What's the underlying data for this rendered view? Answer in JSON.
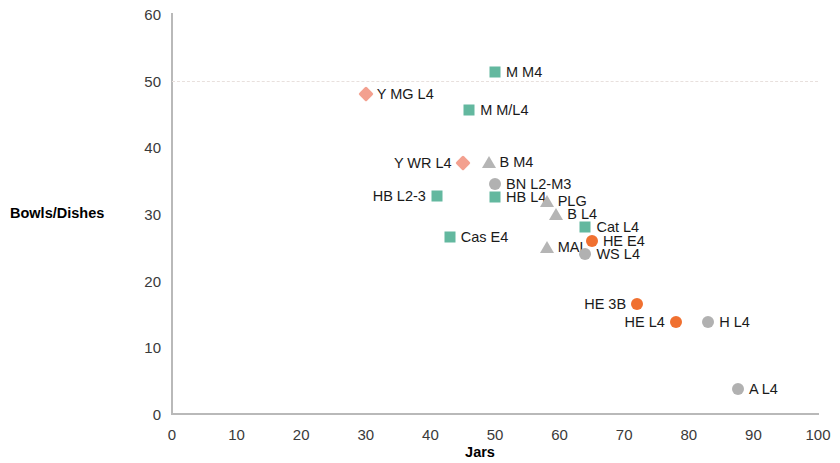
{
  "chart_data": {
    "type": "scatter",
    "title": "",
    "xlabel": "Jars",
    "ylabel": "Bowls/Dishes",
    "xlim": [
      0,
      100
    ],
    "ylim": [
      0,
      60
    ],
    "xticks": [
      0,
      10,
      20,
      30,
      40,
      50,
      60,
      70,
      80,
      90,
      100
    ],
    "yticks": [
      0,
      10,
      20,
      30,
      40,
      50,
      60
    ],
    "grid": "horizontal dashed gridline at y=50 only",
    "legend": "none (points labelled inline)",
    "series": [
      {
        "name": "salmon-diamond",
        "marker": "diamond",
        "color": "#f3a08f",
        "points": [
          {
            "label": "Y MG L4",
            "x": 30.0,
            "y": 48.0,
            "label_side": "right"
          },
          {
            "label": "Y WR L4",
            "x": 45.0,
            "y": 37.6,
            "label_side": "left"
          }
        ]
      },
      {
        "name": "teal-square",
        "marker": "square",
        "color": "#63b89f",
        "points": [
          {
            "label": "M M4",
            "x": 50.0,
            "y": 51.3,
            "label_side": "right"
          },
          {
            "label": "M M/L4",
            "x": 46.0,
            "y": 45.6,
            "label_side": "right"
          },
          {
            "label": "HB L2-3",
            "x": 41.0,
            "y": 32.7,
            "label_side": "left"
          },
          {
            "label": "HB L4",
            "x": 50.0,
            "y": 32.5,
            "label_side": "right"
          },
          {
            "label": "Cas E4",
            "x": 43.0,
            "y": 26.5,
            "label_side": "right"
          },
          {
            "label": "Cat L4",
            "x": 64.0,
            "y": 28.0,
            "label_side": "right"
          }
        ]
      },
      {
        "name": "gray-triangle",
        "marker": "triangle",
        "color": "#b5b5b5",
        "points": [
          {
            "label": "B M4",
            "x": 49.0,
            "y": 37.8,
            "label_side": "right"
          },
          {
            "label": "PLG",
            "x": 58.0,
            "y": 32.0,
            "label_side": "right"
          },
          {
            "label": "B L4",
            "x": 59.5,
            "y": 30.0,
            "label_side": "right"
          },
          {
            "label": "MAL",
            "x": 58.0,
            "y": 25.0,
            "label_side": "right"
          }
        ]
      },
      {
        "name": "gray-circle",
        "marker": "circle",
        "color": "#b1b1b1",
        "points": [
          {
            "label": "BN L2-M3",
            "x": 50.0,
            "y": 34.5,
            "label_side": "right"
          },
          {
            "label": "WS L4",
            "x": 64.0,
            "y": 24.0,
            "label_side": "right"
          },
          {
            "label": "H L4",
            "x": 83.0,
            "y": 13.8,
            "label_side": "right"
          },
          {
            "label": "A L4",
            "x": 87.6,
            "y": 3.75,
            "label_side": "right"
          }
        ]
      },
      {
        "name": "orange-circle",
        "marker": "circle",
        "color": "#f07030",
        "points": [
          {
            "label": "HE E4",
            "x": 65.0,
            "y": 26.0,
            "label_side": "right"
          },
          {
            "label": "HE 3B",
            "x": 72.0,
            "y": 16.5,
            "label_side": "left"
          },
          {
            "label": "HE L4",
            "x": 78.0,
            "y": 13.8,
            "label_side": "left"
          }
        ]
      }
    ]
  }
}
